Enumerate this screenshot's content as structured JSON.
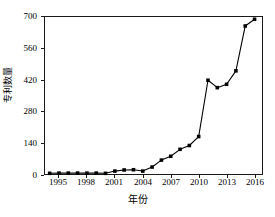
{
  "chart_data": {
    "type": "line",
    "title": "",
    "xlabel": "年份",
    "ylabel": "专利数量",
    "xlim": [
      1993.5,
      2016.8
    ],
    "ylim": [
      0,
      700
    ],
    "grid": false,
    "legend": null,
    "marker": "square",
    "line_color": "#000000",
    "marker_color": "#000000",
    "xticks": [
      "1995",
      "1998",
      "2001",
      "2004",
      "2007",
      "2010",
      "2013",
      "2016"
    ],
    "xtick_values": [
      1995,
      1998,
      2001,
      2004,
      2007,
      2010,
      2013,
      2016
    ],
    "yticks": [
      "0",
      "140",
      "280",
      "420",
      "560",
      "700"
    ],
    "ytick_values": [
      0,
      140,
      280,
      420,
      560,
      700
    ],
    "x": [
      1994,
      1995,
      1996,
      1997,
      1998,
      1999,
      2000,
      2001,
      2002,
      2003,
      2004,
      2005,
      2006,
      2007,
      2008,
      2009,
      2010,
      2011,
      2012,
      2013,
      2014,
      2015,
      2016
    ],
    "values": [
      3,
      4,
      4,
      4,
      4,
      4,
      3,
      13,
      18,
      19,
      13,
      31,
      62,
      79,
      110,
      127,
      167,
      418,
      385,
      400,
      460,
      660,
      690
    ],
    "series": [
      {
        "name": "专利数量",
        "values": [
          3,
          4,
          4,
          4,
          4,
          4,
          3,
          13,
          18,
          19,
          13,
          31,
          62,
          79,
          110,
          127,
          167,
          418,
          385,
          400,
          460,
          660,
          690
        ]
      }
    ]
  },
  "axes": {
    "y_title": "专利数量",
    "x_title": "年份"
  }
}
